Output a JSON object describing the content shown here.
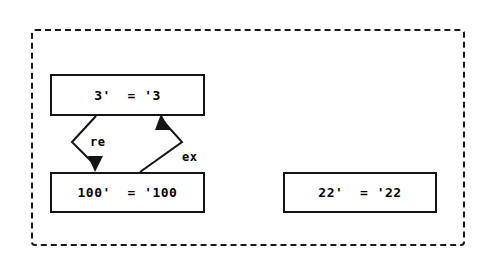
{
  "diagram": {
    "container": {
      "name": "dashed-group-boundary",
      "style": "dashed-rectangle"
    },
    "nodes": [
      {
        "id": "node-top",
        "label": "3'  = '3"
      },
      {
        "id": "node-bottom",
        "label": "100'  = '100"
      },
      {
        "id": "node-right",
        "label": "22'  = '22"
      }
    ],
    "edges": [
      {
        "id": "edge-re",
        "label": "re",
        "from": "node-top",
        "to": "node-bottom",
        "direction": "down",
        "shape": "chevron-left"
      },
      {
        "id": "edge-ex",
        "label": "ex",
        "from": "node-bottom",
        "to": "node-top",
        "direction": "up",
        "shape": "chevron-right"
      }
    ]
  },
  "colors": {
    "background": "#ffffff",
    "stroke": "#141414",
    "dashed_border": "#1a1a1a",
    "text": "#000000"
  }
}
